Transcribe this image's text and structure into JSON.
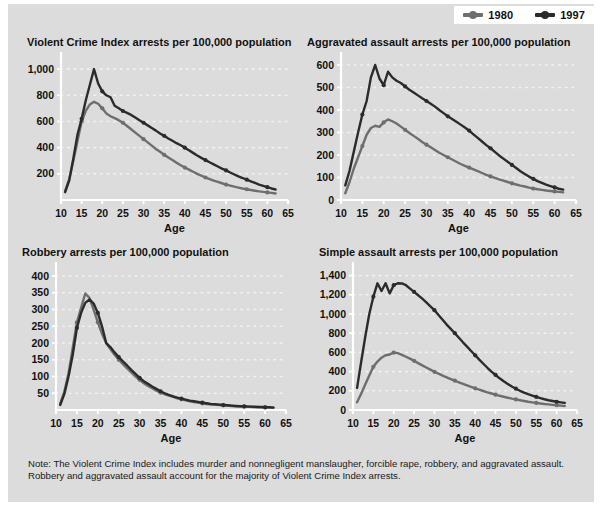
{
  "colors": {
    "panel_bg": "#dcdcdc",
    "page_bg": "#ffffff",
    "series_1980": "#6e6e6e",
    "series_1997": "#2b2b2b",
    "gridline": "#f2f2f2",
    "axis": "#ffffff",
    "text": "#111111"
  },
  "legend": {
    "position": "top-right",
    "items": [
      {
        "label": "1980",
        "color": "#6e6e6e"
      },
      {
        "label": "1997",
        "color": "#2b2b2b"
      }
    ]
  },
  "note": {
    "line1": "Note: The Violent Crime Index includes murder and nonnegligent manslaugher, forcible rape, robbery, and aggravated assault.",
    "line2": "Robbery and aggravated assault account for the majority of Violent Crime Index arrests."
  },
  "chart_data": [
    {
      "id": "violent-crime-index",
      "type": "line",
      "title": "Violent Crime Index arrests per 100,000 population",
      "xlabel": "Age",
      "ylabel": "",
      "xlim": [
        10,
        65
      ],
      "ylim": [
        0,
        1100
      ],
      "xticks": [
        10,
        15,
        20,
        25,
        30,
        35,
        40,
        45,
        50,
        55,
        60,
        65
      ],
      "yticks": [
        200,
        400,
        600,
        800,
        1000
      ],
      "ytick_labels": [
        "200",
        "400",
        "600",
        "800",
        "1,000"
      ],
      "grid": true,
      "legend_position": "figure-top-right",
      "x": [
        11,
        12,
        13,
        14,
        15,
        16,
        17,
        18,
        19,
        20,
        21,
        22,
        23,
        24,
        25,
        26,
        27,
        28,
        29,
        30,
        31,
        32,
        33,
        34,
        35,
        36,
        37,
        38,
        39,
        40,
        41,
        42,
        43,
        44,
        45,
        46,
        47,
        48,
        49,
        50,
        51,
        52,
        53,
        54,
        55,
        56,
        57,
        58,
        59,
        60,
        61,
        62
      ],
      "series": [
        {
          "name": "1980",
          "color": "#6e6e6e",
          "values": [
            70,
            160,
            300,
            450,
            600,
            680,
            730,
            750,
            735,
            700,
            660,
            640,
            625,
            610,
            590,
            565,
            540,
            515,
            490,
            465,
            440,
            415,
            390,
            368,
            345,
            325,
            305,
            285,
            265,
            248,
            232,
            216,
            200,
            186,
            172,
            160,
            148,
            138,
            128,
            118,
            110,
            102,
            95,
            88,
            82,
            76,
            71,
            66,
            62,
            58,
            54,
            50
          ]
        },
        {
          "name": "1997",
          "color": "#2b2b2b",
          "values": [
            60,
            150,
            320,
            500,
            620,
            760,
            880,
            1000,
            890,
            830,
            800,
            785,
            720,
            700,
            680,
            665,
            650,
            630,
            610,
            590,
            570,
            550,
            530,
            508,
            490,
            470,
            452,
            434,
            418,
            400,
            380,
            360,
            340,
            322,
            305,
            288,
            272,
            256,
            240,
            226,
            210,
            195,
            180,
            168,
            155,
            142,
            130,
            118,
            108,
            98,
            88,
            80
          ]
        }
      ]
    },
    {
      "id": "aggravated-assault",
      "type": "line",
      "title": "Aggravated assault arrests per 100,000 population",
      "xlabel": "Age",
      "ylabel": "",
      "xlim": [
        10,
        65
      ],
      "ylim": [
        0,
        640
      ],
      "xticks": [
        10,
        15,
        20,
        25,
        30,
        35,
        40,
        45,
        50,
        55,
        60,
        65
      ],
      "yticks": [
        0,
        100,
        200,
        300,
        400,
        500,
        600
      ],
      "ytick_labels": [
        "0",
        "100",
        "200",
        "300",
        "400",
        "500",
        "600"
      ],
      "grid": true,
      "legend_position": "figure-top-right",
      "x": [
        11,
        12,
        13,
        14,
        15,
        16,
        17,
        18,
        19,
        20,
        21,
        22,
        23,
        24,
        25,
        26,
        27,
        28,
        29,
        30,
        31,
        32,
        33,
        34,
        35,
        36,
        37,
        38,
        39,
        40,
        41,
        42,
        43,
        44,
        45,
        46,
        47,
        48,
        49,
        50,
        51,
        52,
        53,
        54,
        55,
        56,
        57,
        58,
        59,
        60,
        61,
        62
      ],
      "series": [
        {
          "name": "1980",
          "color": "#6e6e6e",
          "values": [
            30,
            80,
            140,
            190,
            240,
            290,
            320,
            330,
            325,
            345,
            358,
            350,
            340,
            326,
            312,
            298,
            285,
            272,
            258,
            246,
            234,
            222,
            210,
            200,
            190,
            180,
            170,
            160,
            152,
            144,
            136,
            128,
            120,
            112,
            105,
            98,
            92,
            86,
            80,
            74,
            69,
            64,
            60,
            55,
            51,
            48,
            45,
            42,
            40,
            38,
            36,
            34
          ]
        },
        {
          "name": "1997",
          "color": "#2b2b2b",
          "values": [
            65,
            130,
            215,
            300,
            380,
            440,
            545,
            600,
            540,
            510,
            570,
            545,
            530,
            520,
            505,
            490,
            478,
            465,
            452,
            440,
            428,
            415,
            400,
            386,
            372,
            360,
            348,
            335,
            322,
            308,
            292,
            276,
            260,
            244,
            230,
            214,
            198,
            184,
            170,
            156,
            142,
            128,
            116,
            104,
            94,
            84,
            76,
            68,
            62,
            56,
            50,
            46
          ]
        }
      ]
    },
    {
      "id": "robbery",
      "type": "line",
      "title": "Robbery arrests per 100,000 population",
      "xlabel": "Age",
      "ylabel": "",
      "xlim": [
        10,
        65
      ],
      "ylim": [
        0,
        430
      ],
      "xticks": [
        10,
        15,
        20,
        25,
        30,
        35,
        40,
        45,
        50,
        55,
        60,
        65
      ],
      "yticks": [
        50,
        100,
        150,
        200,
        250,
        300,
        350,
        400
      ],
      "ytick_labels": [
        "50",
        "100",
        "150",
        "200",
        "250",
        "300",
        "350",
        "400"
      ],
      "grid": true,
      "legend_position": "figure-top-right",
      "x": [
        11,
        12,
        13,
        14,
        15,
        16,
        17,
        18,
        19,
        20,
        21,
        22,
        23,
        24,
        25,
        26,
        27,
        28,
        29,
        30,
        31,
        32,
        33,
        34,
        35,
        36,
        37,
        38,
        39,
        40,
        41,
        42,
        43,
        44,
        45,
        46,
        47,
        48,
        49,
        50,
        51,
        52,
        53,
        54,
        55,
        56,
        57,
        58,
        59,
        60,
        61,
        62
      ],
      "series": [
        {
          "name": "1980",
          "color": "#6e6e6e",
          "values": [
            18,
            55,
            110,
            185,
            262,
            305,
            348,
            335,
            300,
            262,
            228,
            200,
            182,
            165,
            150,
            137,
            124,
            112,
            100,
            90,
            80,
            72,
            65,
            58,
            52,
            47,
            43,
            39,
            35,
            32,
            29,
            26,
            24,
            22,
            20,
            18,
            17,
            16,
            15,
            14,
            13,
            12,
            11,
            11,
            10,
            10,
            9,
            9,
            8,
            8,
            8,
            7
          ]
        },
        {
          "name": "1997",
          "color": "#2b2b2b",
          "values": [
            15,
            48,
            100,
            165,
            245,
            290,
            320,
            330,
            318,
            290,
            250,
            200,
            188,
            172,
            158,
            145,
            133,
            120,
            108,
            96,
            86,
            78,
            70,
            63,
            56,
            50,
            45,
            41,
            37,
            34,
            31,
            28,
            26,
            24,
            22,
            20,
            18,
            17,
            16,
            15,
            14,
            13,
            12,
            11,
            11,
            10,
            10,
            9,
            9,
            8,
            8,
            7
          ]
        }
      ]
    },
    {
      "id": "simple-assault",
      "type": "line",
      "title": "Simple assault arrests per 100,000 population",
      "xlabel": "Age",
      "ylabel": "",
      "xlim": [
        10,
        65
      ],
      "ylim": [
        0,
        1500
      ],
      "xticks": [
        10,
        15,
        20,
        25,
        30,
        35,
        40,
        45,
        50,
        55,
        60,
        65
      ],
      "yticks": [
        0,
        200,
        400,
        600,
        800,
        1000,
        1200,
        1400
      ],
      "ytick_labels": [
        "0",
        "200",
        "400",
        "600",
        "800",
        "1,000",
        "1,200",
        "1,400"
      ],
      "grid": true,
      "legend_position": "figure-top-right",
      "x": [
        11,
        12,
        13,
        14,
        15,
        16,
        17,
        18,
        19,
        20,
        21,
        22,
        23,
        24,
        25,
        26,
        27,
        28,
        29,
        30,
        31,
        32,
        33,
        34,
        35,
        36,
        37,
        38,
        39,
        40,
        41,
        42,
        43,
        44,
        45,
        46,
        47,
        48,
        49,
        50,
        51,
        52,
        53,
        54,
        55,
        56,
        57,
        58,
        59,
        60,
        61,
        62
      ],
      "series": [
        {
          "name": "1980",
          "color": "#6e6e6e",
          "values": [
            80,
            170,
            265,
            360,
            450,
            505,
            545,
            570,
            578,
            598,
            592,
            575,
            555,
            535,
            512,
            488,
            465,
            442,
            420,
            398,
            378,
            358,
            340,
            322,
            305,
            288,
            272,
            256,
            240,
            226,
            212,
            198,
            184,
            172,
            160,
            148,
            138,
            128,
            118,
            110,
            102,
            94,
            86,
            80,
            74,
            68,
            62,
            58,
            54,
            50,
            46,
            42
          ]
        },
        {
          "name": "1997",
          "color": "#2b2b2b",
          "values": [
            230,
            500,
            760,
            1000,
            1180,
            1320,
            1240,
            1320,
            1215,
            1300,
            1320,
            1318,
            1300,
            1265,
            1230,
            1195,
            1160,
            1120,
            1080,
            1040,
            990,
            940,
            890,
            845,
            800,
            752,
            705,
            660,
            615,
            570,
            525,
            482,
            440,
            400,
            365,
            330,
            300,
            272,
            245,
            222,
            200,
            182,
            165,
            150,
            136,
            124,
            112,
            102,
            94,
            86,
            80,
            74
          ]
        }
      ]
    }
  ]
}
